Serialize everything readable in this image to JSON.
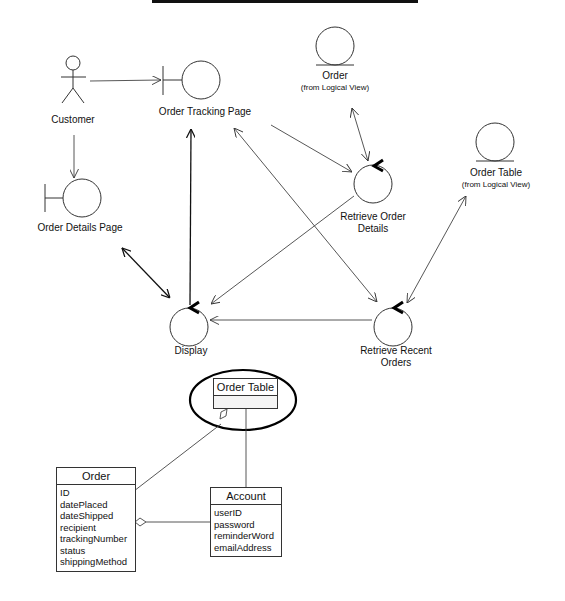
{
  "diagram": {
    "top_rule": true,
    "actors": [
      {
        "id": "customer",
        "label": "Customer"
      }
    ],
    "boundaries": [
      {
        "id": "order-tracking-page",
        "label": "Order Tracking Page"
      },
      {
        "id": "order-details-page",
        "label": "Order Details Page"
      }
    ],
    "controls": [
      {
        "id": "retrieve-order-details",
        "label_line1": "Retrieve Order",
        "label_line2": "Details"
      },
      {
        "id": "display",
        "label": "Display"
      },
      {
        "id": "retrieve-recent-orders",
        "label_line1": "Retrieve Recent",
        "label_line2": "Orders"
      }
    ],
    "entities": [
      {
        "id": "order",
        "label": "Order",
        "sublabel": "(from Logical View)"
      },
      {
        "id": "order-table",
        "label": "Order Table",
        "sublabel": "(from Logical View)"
      }
    ],
    "links": [
      {
        "from": "Customer",
        "to": "Order Tracking Page",
        "type": "directed"
      },
      {
        "from": "Customer",
        "to": "Order Details Page",
        "type": "directed"
      },
      {
        "from": "Order Tracking Page",
        "to": "Retrieve Order Details",
        "type": "directed"
      },
      {
        "from": "Order",
        "to": "Retrieve Order Details",
        "type": "bidirectional"
      },
      {
        "from": "Order Tracking Page",
        "to": "Retrieve Recent Orders",
        "type": "bidirectional"
      },
      {
        "from": "Display",
        "to": "Order Tracking Page",
        "type": "directed"
      },
      {
        "from": "Retrieve Order Details",
        "to": "Display",
        "type": "directed"
      },
      {
        "from": "Order Details Page",
        "to": "Display",
        "type": "bidirectional"
      },
      {
        "from": "Retrieve Recent Orders",
        "to": "Display",
        "type": "directed"
      },
      {
        "from": "Order Table",
        "to": "Retrieve Recent Orders",
        "type": "bidirectional"
      }
    ],
    "class_diagram": {
      "highlighted_class": {
        "name": "Order Table",
        "attributes": []
      },
      "classes": [
        {
          "name": "Order",
          "attributes": [
            "ID",
            "datePlaced",
            "dateShipped",
            "recipient",
            "trackingNumber",
            "status",
            "shippingMethod"
          ]
        },
        {
          "name": "Account",
          "attributes": [
            "userID",
            "password",
            "reminderWord",
            "emailAddress"
          ]
        }
      ],
      "relations": [
        {
          "from": "Order Table",
          "to": "Order",
          "type": "aggregation"
        },
        {
          "from": "Order Table",
          "to": "Account",
          "type": "association"
        },
        {
          "from": "Order",
          "to": "Account",
          "type": "aggregation"
        }
      ]
    }
  }
}
